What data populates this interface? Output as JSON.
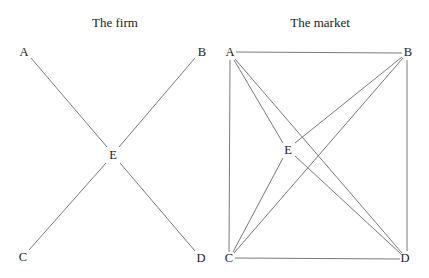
{
  "diagrams": [
    {
      "id": "firm",
      "title": "The firm",
      "title_pos": {
        "x": 115,
        "y": 16
      },
      "nodes": [
        {
          "label": "A",
          "x": 24,
          "y": 52
        },
        {
          "label": "B",
          "x": 202,
          "y": 52
        },
        {
          "label": "E",
          "x": 113,
          "y": 155
        },
        {
          "label": "C",
          "x": 23,
          "y": 257
        },
        {
          "label": "D",
          "x": 201,
          "y": 258
        }
      ],
      "edges": [
        {
          "from": "A",
          "to": "E",
          "x1": 31,
          "y1": 58,
          "x2": 107,
          "y2": 147
        },
        {
          "from": "B",
          "to": "E",
          "x1": 195,
          "y1": 58,
          "x2": 119,
          "y2": 147
        },
        {
          "from": "C",
          "to": "E",
          "x1": 29,
          "y1": 250,
          "x2": 106,
          "y2": 163
        },
        {
          "from": "D",
          "to": "E",
          "x1": 195,
          "y1": 251,
          "x2": 120,
          "y2": 163
        }
      ]
    },
    {
      "id": "market",
      "title": "The market",
      "title_pos": {
        "x": 320,
        "y": 16
      },
      "nodes": [
        {
          "label": "A",
          "x": 230,
          "y": 52
        },
        {
          "label": "B",
          "x": 408,
          "y": 52
        },
        {
          "label": "E",
          "x": 288,
          "y": 150
        },
        {
          "label": "C",
          "x": 229,
          "y": 258
        },
        {
          "label": "D",
          "x": 405,
          "y": 258
        }
      ],
      "edges": [
        {
          "from": "A",
          "to": "B",
          "x1": 236,
          "y1": 52,
          "x2": 402,
          "y2": 53
        },
        {
          "from": "A",
          "to": "C",
          "x1": 230,
          "y1": 60,
          "x2": 229,
          "y2": 252
        },
        {
          "from": "B",
          "to": "D",
          "x1": 407,
          "y1": 60,
          "x2": 407,
          "y2": 251
        },
        {
          "from": "C",
          "to": "D",
          "x1": 235,
          "y1": 258,
          "x2": 400,
          "y2": 259
        },
        {
          "from": "A",
          "to": "D",
          "x1": 235,
          "y1": 59,
          "x2": 402,
          "y2": 253
        },
        {
          "from": "B",
          "to": "C",
          "x1": 403,
          "y1": 58,
          "x2": 234,
          "y2": 253
        },
        {
          "from": "A",
          "to": "E",
          "x1": 234,
          "y1": 60,
          "x2": 283,
          "y2": 143
        },
        {
          "from": "B",
          "to": "E",
          "x1": 402,
          "y1": 57,
          "x2": 295,
          "y2": 143
        },
        {
          "from": "C",
          "to": "E",
          "x1": 233,
          "y1": 252,
          "x2": 283,
          "y2": 158
        },
        {
          "from": "D",
          "to": "E",
          "x1": 401,
          "y1": 254,
          "x2": 295,
          "y2": 156
        }
      ]
    }
  ]
}
